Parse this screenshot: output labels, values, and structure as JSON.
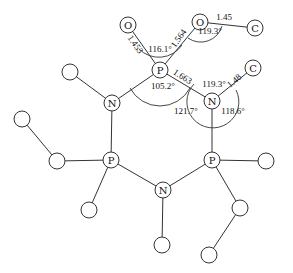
{
  "diagram": {
    "title": "",
    "atoms": [
      {
        "id": "O1",
        "label": "O",
        "x": 128,
        "y": 25,
        "r": 8
      },
      {
        "id": "O2",
        "label": "O",
        "x": 200,
        "y": 22,
        "r": 8
      },
      {
        "id": "C1",
        "label": "C",
        "x": 255,
        "y": 28,
        "r": 8
      },
      {
        "id": "P1",
        "label": "P",
        "x": 160,
        "y": 70,
        "r": 8
      },
      {
        "id": "N1",
        "label": "N",
        "x": 212,
        "y": 101,
        "r": 8
      },
      {
        "id": "C2",
        "label": "C",
        "x": 253,
        "y": 68,
        "r": 8
      },
      {
        "id": "N2",
        "label": "N",
        "x": 112,
        "y": 103,
        "r": 8
      },
      {
        "id": "X1",
        "label": "",
        "x": 70,
        "y": 72,
        "r": 8
      },
      {
        "id": "P2",
        "label": "P",
        "x": 111,
        "y": 160,
        "r": 8
      },
      {
        "id": "X2",
        "label": "",
        "x": 57,
        "y": 161,
        "r": 8
      },
      {
        "id": "X3",
        "label": "",
        "x": 22,
        "y": 119,
        "r": 8
      },
      {
        "id": "X4",
        "label": "",
        "x": 89,
        "y": 210,
        "r": 8
      },
      {
        "id": "N3",
        "label": "N",
        "x": 163,
        "y": 190,
        "r": 8
      },
      {
        "id": "X5",
        "label": "",
        "x": 162,
        "y": 245,
        "r": 8
      },
      {
        "id": "P3",
        "label": "P",
        "x": 212,
        "y": 160,
        "r": 8
      },
      {
        "id": "X6",
        "label": "",
        "x": 266,
        "y": 161,
        "r": 8
      },
      {
        "id": "X7",
        "label": "",
        "x": 240,
        "y": 208,
        "r": 8
      },
      {
        "id": "X8",
        "label": "",
        "x": 209,
        "y": 255,
        "r": 8
      }
    ],
    "bonds": [
      [
        "O1",
        "P1"
      ],
      [
        "O2",
        "P1"
      ],
      [
        "O2",
        "C1"
      ],
      [
        "P1",
        "N1"
      ],
      [
        "N1",
        "C2"
      ],
      [
        "P1",
        "N2"
      ],
      [
        "N2",
        "X1"
      ],
      [
        "N2",
        "P2"
      ],
      [
        "P2",
        "X2"
      ],
      [
        "X2",
        "X3"
      ],
      [
        "P2",
        "X4"
      ],
      [
        "P2",
        "N3"
      ],
      [
        "N3",
        "X5"
      ],
      [
        "N3",
        "P3"
      ],
      [
        "P3",
        "N1"
      ],
      [
        "P3",
        "X6"
      ],
      [
        "P3",
        "X7"
      ],
      [
        "X7",
        "X8"
      ]
    ],
    "bond_lengths": [
      {
        "text": "1.453",
        "x": 133,
        "y": 46,
        "rotate": 55
      },
      {
        "text": "1.564",
        "x": 181,
        "y": 40,
        "rotate": -55
      },
      {
        "text": "1.45",
        "x": 224,
        "y": 20,
        "rotate": 0
      },
      {
        "text": "1.663",
        "x": 181,
        "y": 79,
        "rotate": 33
      },
      {
        "text": "1.48",
        "x": 236,
        "y": 83,
        "rotate": -40
      }
    ],
    "angles": [
      {
        "text": "116.1°",
        "x": 160,
        "y": 52
      },
      {
        "text": "119.3°",
        "x": 210,
        "y": 34
      },
      {
        "text": "105.2°",
        "x": 163,
        "y": 89
      },
      {
        "text": "119.3°",
        "x": 214,
        "y": 87
      },
      {
        "text": "121.7°",
        "x": 186,
        "y": 114
      },
      {
        "text": "118.6°",
        "x": 233,
        "y": 114
      }
    ]
  }
}
